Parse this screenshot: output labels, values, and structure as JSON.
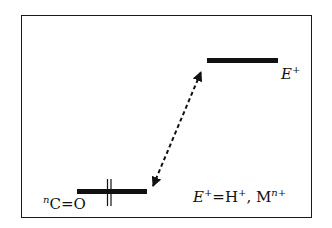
{
  "diagram": {
    "title": "",
    "levels": [
      {
        "id": "upper",
        "label_main": "E",
        "label_sup": "+"
      },
      {
        "id": "lower",
        "label_sup": "n",
        "label_main": "C=O"
      }
    ],
    "legend": {
      "e_main": "E",
      "e_sup": "+",
      "eq": "=H",
      "h_sup": "+",
      "sep": ", M",
      "m_sup": "n+"
    },
    "arrow": {
      "style": "dashed",
      "direction": "bidirectional"
    },
    "colors": {
      "ink": "#111111",
      "background": "#ffffff"
    }
  }
}
